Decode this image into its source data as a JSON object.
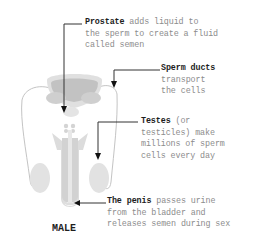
{
  "diagram": {
    "title": "MALE",
    "labels": [
      {
        "id": "prostate",
        "term": "Prostate",
        "lines": [
          " adds liquid to",
          "the sperm to create a fluid",
          "called semen"
        ]
      },
      {
        "id": "sperm-ducts",
        "term": "Sperm ducts",
        "lines": [
          "",
          "transport",
          "the cells"
        ]
      },
      {
        "id": "testes",
        "term": "Testes",
        "lines": [
          " (or",
          "testicles) make",
          "millions of sperm",
          "cells every day"
        ]
      },
      {
        "id": "penis",
        "term": "The penis",
        "lines": [
          " passes urine",
          "from the bladder and",
          "releases semen during sex"
        ]
      }
    ],
    "colors": {
      "organ_light": "#e3e3e3",
      "organ_mid": "#c9c9c9",
      "organ_dark": "#b3b3b3",
      "duct_line": "#bdbdbd",
      "pointer_line": "#333333",
      "term_text": "#1e1e1e",
      "body_text": "#8c8c8c"
    }
  }
}
